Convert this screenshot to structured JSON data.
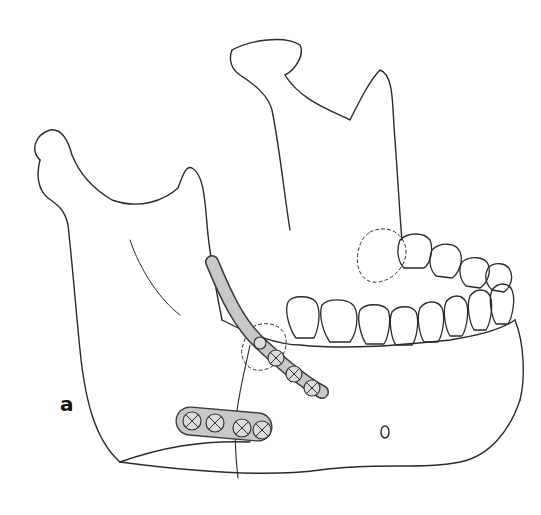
{
  "figure": {
    "panel_label": "a",
    "elements": [
      {
        "name": "mandible-bone",
        "description": "lateral oblique view of lower jaw"
      },
      {
        "name": "lower-border-plate",
        "holes": 4
      },
      {
        "name": "oblique-line-plate",
        "holes": 4
      },
      {
        "name": "teeth-row"
      }
    ],
    "colors": {
      "line": "#2a2a2a",
      "plate_fill": "#c8c8c8",
      "plate_stroke": "#3a3a3a",
      "background": "#ffffff"
    }
  }
}
